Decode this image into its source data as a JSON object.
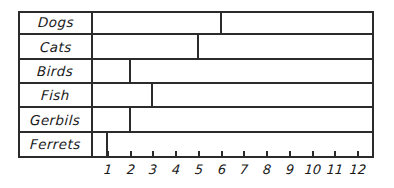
{
  "chart_data": {
    "type": "bar",
    "orientation": "horizontal",
    "title": "",
    "xlabel": "",
    "ylabel": "",
    "categories": [
      "Dogs",
      "Cats",
      "Birds",
      "Fish",
      "Gerbils",
      "Ferrets"
    ],
    "values": [
      6,
      5,
      2,
      3,
      2,
      1
    ],
    "xlim": [
      0,
      12
    ],
    "xticks": [
      1,
      2,
      3,
      4,
      5,
      6,
      7,
      8,
      9,
      10,
      11,
      12
    ],
    "xtick_labels": [
      "1",
      "2",
      "3",
      "4",
      "5",
      "6",
      "7",
      "8",
      "9",
      "10",
      "11",
      "12"
    ],
    "grid": false,
    "legend": false,
    "style": "hand-drawn",
    "colors": {
      "line": "#2b2b2b",
      "background": "#ffffff",
      "bar_fill": "transparent",
      "text": "#1a1a1a"
    }
  },
  "rows": [
    {
      "label": "Dogs",
      "value": 6
    },
    {
      "label": "Cats",
      "value": 5
    },
    {
      "label": "Birds",
      "value": 2
    },
    {
      "label": "Fish",
      "value": 3
    },
    {
      "label": "Gerbils",
      "value": 2
    },
    {
      "label": "Ferrets",
      "value": 1
    }
  ],
  "axis": {
    "ticks": [
      {
        "label": "1"
      },
      {
        "label": "2"
      },
      {
        "label": "3"
      },
      {
        "label": "4"
      },
      {
        "label": "5"
      },
      {
        "label": "6"
      },
      {
        "label": "7"
      },
      {
        "label": "8"
      },
      {
        "label": "9"
      },
      {
        "label": "10"
      },
      {
        "label": "11"
      },
      {
        "label": "12"
      }
    ]
  }
}
